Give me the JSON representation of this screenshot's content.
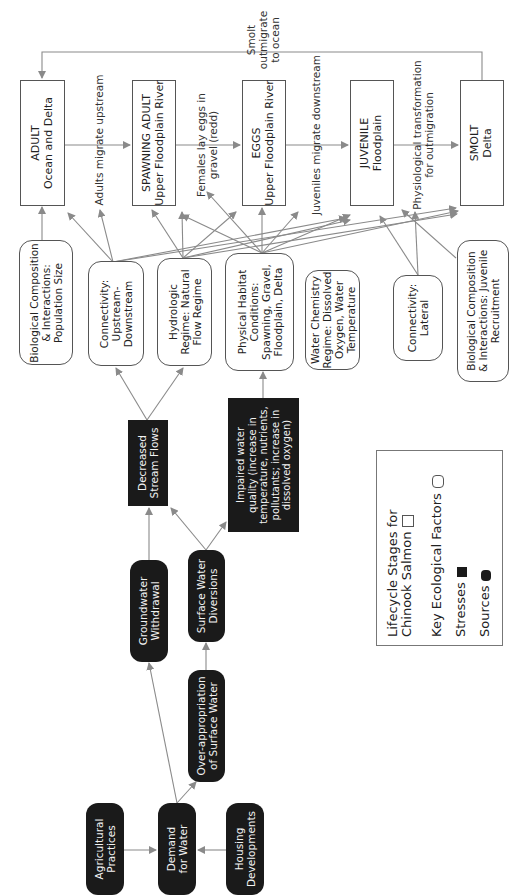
{
  "diagram": {
    "lifecycle_stages": [
      {
        "id": "adult",
        "title": "ADULT",
        "subtitle": "Ocean and Delta"
      },
      {
        "id": "spawning-adult",
        "title": "SPAWNING ADULT",
        "subtitle": "Upper Floodplain River"
      },
      {
        "id": "eggs",
        "title": "EGGS",
        "subtitle": "Upper Floodplain River"
      },
      {
        "id": "juvenile",
        "title": "JUVENILE",
        "subtitle": "Floodplain"
      },
      {
        "id": "smolt",
        "title": "SMOLT",
        "subtitle": "Delta"
      }
    ],
    "transitions": [
      {
        "line1": "Adults migrate upstream",
        "line2": ""
      },
      {
        "line1": "Females lay eggs in",
        "line2": "gravel (redd)"
      },
      {
        "line1": "Juveniles migrate downstream",
        "line2": ""
      },
      {
        "line1": "Physiological transformation",
        "line2": "for outmigration"
      }
    ],
    "feedback": {
      "line1": "Smolt",
      "line2": "outmigrate",
      "line3": "to ocean"
    },
    "ecological_factors": [
      {
        "id": "bio-pop",
        "lines": [
          "Biological Composition",
          "& Interactions:",
          "Population Size"
        ]
      },
      {
        "id": "conn-up",
        "lines": [
          "Connectivity:",
          "Upstream-",
          "Downstream"
        ]
      },
      {
        "id": "hydro",
        "lines": [
          "Hydrologic",
          "Regime: Natural",
          "Flow Regime"
        ]
      },
      {
        "id": "phys",
        "lines": [
          "Physical Habitat",
          "Conditions:",
          "Spawning, Gravel,",
          "Floodplain, Delta"
        ]
      },
      {
        "id": "water-chem",
        "lines": [
          "Water Chemistry",
          "Regime: Dissolved",
          "Oxygen, Water",
          "Temperature"
        ]
      },
      {
        "id": "conn-lat",
        "lines": [
          "Connectivity:",
          "Lateral"
        ]
      },
      {
        "id": "bio-juv",
        "lines": [
          "Biological Composition",
          "& Interactions: Juvenile",
          "Recruitment"
        ]
      }
    ],
    "stresses": [
      {
        "id": "stream-flows",
        "lines": [
          "Decreased",
          "Stream Flows"
        ]
      },
      {
        "id": "water-quality",
        "lines": [
          "Impaired water",
          "quality (increase in",
          "temperature, nutrients,",
          "pollutants; increase in",
          "dissolved oxygen)"
        ]
      }
    ],
    "sources": [
      {
        "id": "groundwater",
        "lines": [
          "Groundwater",
          "Withdrawal"
        ]
      },
      {
        "id": "diversions",
        "lines": [
          "Surface Water",
          "Diversions"
        ]
      },
      {
        "id": "over-approp",
        "lines": [
          "Over-appropriation",
          "of Surface Water"
        ]
      },
      {
        "id": "demand",
        "lines": [
          "Demand",
          "for Water"
        ]
      },
      {
        "id": "agri",
        "lines": [
          "Agricultural",
          "Practices"
        ]
      },
      {
        "id": "housing",
        "lines": [
          "Housing",
          "Developments"
        ]
      }
    ],
    "legend": {
      "lifecycle_line1": "Lifecycle Stages for",
      "lifecycle_line2": "Chinook Salmon",
      "factors": "Key Ecological Factors",
      "stresses": "Stresses",
      "sources": "Sources"
    },
    "colors": {
      "line": "#8a8a8a",
      "dark_fill": "#1a1a1a",
      "border": "#555555"
    }
  }
}
